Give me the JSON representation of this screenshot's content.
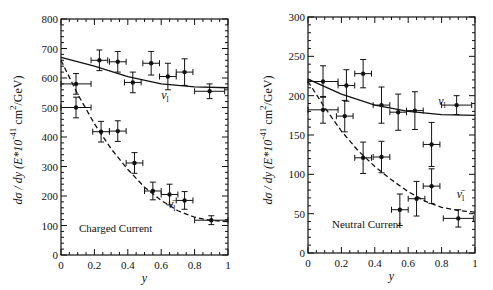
{
  "chart_data": [
    {
      "type": "scatter",
      "title": "",
      "annotation": "Charged Current",
      "xlabel": "y",
      "ylabel": "dσ / dy (E*10^-41 cm^2/GeV)",
      "xlim": [
        0,
        1
      ],
      "ylim": [
        0,
        800
      ],
      "xticks": [
        "0",
        "0.2",
        "0.4",
        "0.6",
        "0.8",
        "1"
      ],
      "yticks": [
        "0",
        "100",
        "200",
        "300",
        "400",
        "500",
        "600",
        "700",
        "800"
      ],
      "grid": false,
      "series": [
        {
          "name": "ν_l",
          "style": "points-with-errorbars",
          "x": [
            0.09,
            0.23,
            0.34,
            0.43,
            0.54,
            0.64,
            0.74,
            0.89
          ],
          "y": [
            580,
            660,
            655,
            585,
            650,
            605,
            620,
            555
          ],
          "yerr": [
            35,
            35,
            35,
            35,
            40,
            45,
            45,
            25
          ],
          "xerr": [
            0.09,
            0.05,
            0.05,
            0.05,
            0.05,
            0.05,
            0.05,
            0.09
          ]
        },
        {
          "name": "ν̄_l",
          "style": "points-with-errorbars",
          "x": [
            0.09,
            0.24,
            0.34,
            0.44,
            0.55,
            0.65,
            0.74,
            0.9
          ],
          "y": [
            500,
            418,
            420,
            312,
            217,
            205,
            185,
            118
          ],
          "yerr": [
            35,
            35,
            35,
            35,
            30,
            35,
            30,
            15
          ],
          "xerr": [
            0.09,
            0.05,
            0.05,
            0.05,
            0.05,
            0.05,
            0.05,
            0.1
          ]
        },
        {
          "name": "ν_l model",
          "style": "solid-line",
          "x": [
            0,
            0.2,
            0.4,
            0.6,
            0.8,
            1.0
          ],
          "y": [
            670,
            640,
            605,
            580,
            570,
            567
          ]
        },
        {
          "name": "ν̄_l model",
          "style": "dashed-line",
          "x": [
            0,
            0.1,
            0.2,
            0.3,
            0.4,
            0.5,
            0.6,
            0.7,
            0.8,
            0.9,
            1.0
          ],
          "y": [
            660,
            545,
            445,
            360,
            290,
            230,
            185,
            150,
            128,
            117,
            113
          ]
        }
      ],
      "labels": [
        {
          "text": "ν",
          "sub": "l",
          "x": 0.6,
          "y": 530
        },
        {
          "text": "ν̄",
          "sub": "l",
          "x": 0.64,
          "y": 160
        }
      ]
    },
    {
      "type": "scatter",
      "title": "",
      "annotation": "Neutral Current",
      "xlabel": "y",
      "ylabel": "dσ / dy (E*10^-41 cm^2/GeV)",
      "xlim": [
        0,
        1
      ],
      "ylim": [
        0,
        300
      ],
      "xticks": [
        "0",
        "0.2",
        "0.4",
        "0.6",
        "0.8",
        "1"
      ],
      "yticks": [
        "0",
        "50",
        "100",
        "150",
        "200",
        "250",
        "300"
      ],
      "grid": false,
      "series": [
        {
          "name": "ν_l",
          "style": "points-with-errorbars",
          "x": [
            0.09,
            0.23,
            0.33,
            0.44,
            0.54,
            0.64,
            0.89
          ],
          "y": [
            218,
            213,
            228,
            188,
            179,
            181,
            188
          ],
          "yerr": [
            20,
            20,
            18,
            23,
            23,
            24,
            12
          ],
          "xerr": [
            0.09,
            0.05,
            0.05,
            0.05,
            0.05,
            0.05,
            0.09
          ]
        },
        {
          "name": "ν̄_l",
          "style": "points-with-errorbars",
          "x": [
            0.09,
            0.22,
            0.33,
            0.44,
            0.55,
            0.65,
            0.74,
            0.74,
            0.9
          ],
          "y": [
            182,
            174,
            121,
            122,
            55,
            69,
            85,
            138,
            44
          ],
          "yerr": [
            17,
            20,
            20,
            20,
            20,
            22,
            22,
            28,
            11
          ],
          "xerr": [
            0.09,
            0.05,
            0.05,
            0.05,
            0.05,
            0.05,
            0.05,
            0.05,
            0.09
          ]
        },
        {
          "name": "ν_l model",
          "style": "solid-line",
          "x": [
            0,
            0.2,
            0.4,
            0.6,
            0.8,
            1.0
          ],
          "y": [
            221,
            202,
            188,
            180,
            176,
            175
          ],
          "note": ""
        },
        {
          "name": "ν̄_l model",
          "style": "dashed-line",
          "x": [
            0,
            0.1,
            0.2,
            0.3,
            0.4,
            0.5,
            0.6,
            0.7,
            0.8,
            0.9,
            1.0
          ],
          "y": [
            218,
            185,
            155,
            130,
            110,
            93,
            78,
            66,
            58,
            54,
            52
          ]
        }
      ],
      "labels": [
        {
          "text": "ν",
          "sub": "l",
          "x": 0.78,
          "y": 188
        },
        {
          "text": "ν̄",
          "sub": "l",
          "x": 0.89,
          "y": 70
        }
      ]
    }
  ],
  "charts": [
    {
      "annotation": "Charged Current",
      "xlabel": "y",
      "ylabel_main": "dσ / dy (E*10",
      "ylabel_exp": "-41",
      "ylabel_tail": "cm",
      "ylabel_exp2": "2",
      "ylabel_unit": "/GeV)"
    },
    {
      "annotation": "Neutral Current",
      "xlabel": "y",
      "ylabel_main": "dσ / dy (E*10",
      "ylabel_exp": "-41",
      "ylabel_tail": "cm",
      "ylabel_exp2": "2",
      "ylabel_unit": "/GeV)"
    }
  ]
}
